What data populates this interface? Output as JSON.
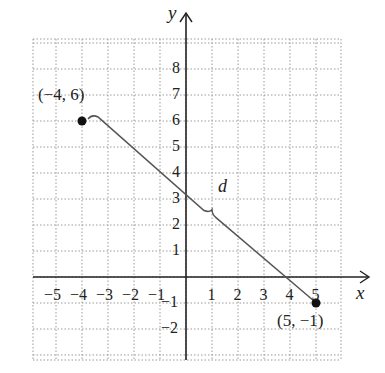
{
  "diagram": {
    "type": "coordinate-plane",
    "axes": {
      "x_label": "x",
      "y_label": "y",
      "x_ticks": [
        "-5",
        "-4",
        "-3",
        "-2",
        "-1",
        "1",
        "2",
        "3",
        "4",
        "5"
      ],
      "y_ticks": [
        "8",
        "7",
        "6",
        "5",
        "4",
        "3",
        "2",
        "1",
        "-1",
        "-2"
      ]
    },
    "points": [
      {
        "label": "(−4, 6)",
        "x": -4,
        "y": 6
      },
      {
        "label": "(5, −1)",
        "x": 5,
        "y": -1
      }
    ],
    "segment": {
      "from": [
        -4,
        6
      ],
      "to": [
        5,
        -1
      ],
      "label": "d"
    },
    "colors": {
      "axis": "#222222",
      "grid": "#9a9a9a",
      "segment": "#555555",
      "point": "#111111"
    }
  }
}
